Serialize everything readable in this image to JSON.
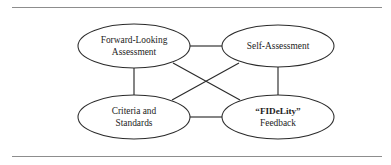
{
  "figure": {
    "type": "concept-diagram",
    "background_color": "#ffffff",
    "line_color": "#2b2b2b",
    "text_color": "#1d1d1d",
    "rule_color": "#8d8d8d",
    "nodes": [
      {
        "id": "forward-looking-assessment",
        "lines": [
          "Forward-Looking",
          "Assessment"
        ],
        "line1": "Forward-Looking",
        "line2": "Assessment",
        "bold": false,
        "cx": 134,
        "cy": 46,
        "rx": 56,
        "ry": 22
      },
      {
        "id": "self-assessment",
        "lines": [
          "Self-Assessment"
        ],
        "line1": "Self-Assessment",
        "line2": "",
        "bold": false,
        "cx": 278,
        "cy": 46,
        "rx": 56,
        "ry": 21
      },
      {
        "id": "criteria-and-standards",
        "lines": [
          "Criteria and",
          "Standards"
        ],
        "line1": "Criteria and",
        "line2": "Standards",
        "bold": false,
        "cx": 134,
        "cy": 117,
        "rx": 56,
        "ry": 22
      },
      {
        "id": "fidelity-feedback",
        "lines": [
          "“FIDeLity”",
          "Feedback"
        ],
        "line1": "“FIDeLity”",
        "line2": "Feedback",
        "bold": true,
        "cx": 278,
        "cy": 117,
        "rx": 56,
        "ry": 22
      }
    ],
    "edges": [
      {
        "id": "top-horizontal",
        "from": "forward-looking-assessment",
        "to": "self-assessment"
      },
      {
        "id": "left-vertical",
        "from": "forward-looking-assessment",
        "to": "criteria-and-standards"
      },
      {
        "id": "right-vertical",
        "from": "self-assessment",
        "to": "fidelity-feedback"
      },
      {
        "id": "bottom-horizontal",
        "from": "criteria-and-standards",
        "to": "fidelity-feedback"
      },
      {
        "id": "diagonal-fla-to-fidelity",
        "from": "forward-looking-assessment",
        "to": "fidelity-feedback"
      },
      {
        "id": "diagonal-self-to-criteria",
        "from": "self-assessment",
        "to": "criteria-and-standards"
      }
    ]
  }
}
